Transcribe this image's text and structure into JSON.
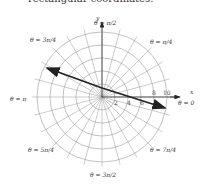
{
  "caption": "rectangular coordinates.",
  "diagram": {
    "type": "polar-grid",
    "rings": [
      2,
      4,
      6,
      8,
      10
    ],
    "tick_labels": [
      "2",
      "4",
      "6",
      "8",
      "10"
    ],
    "axis_labels": {
      "x": "x",
      "y": "y"
    },
    "angle_labels": {
      "a0": "θ = 0",
      "a45": "θ = π/4",
      "a90": "θ = π/2",
      "a135": "θ = 3π/4",
      "a180": "θ = π",
      "a225": "θ = 5π/4",
      "a270": "θ = 3π/2",
      "a315": "θ = 7π/4"
    },
    "line": {
      "description": "double-headed line across the polar grid"
    }
  }
}
